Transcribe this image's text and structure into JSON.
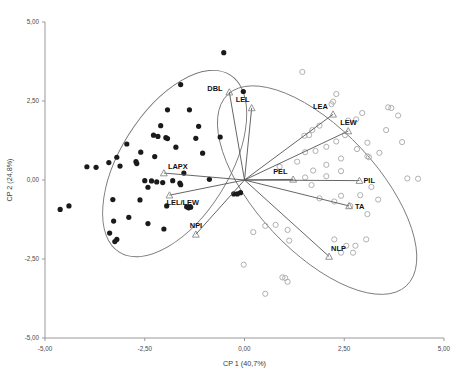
{
  "chart_data": {
    "type": "scatter",
    "subtype": "pca-biplot",
    "title": "",
    "xlabel": "CP 1 (40,7%)",
    "ylabel": "CP 2 (24,8%)",
    "xlim": [
      -5.0,
      5.0
    ],
    "ylim": [
      -5.0,
      5.0
    ],
    "xticks": [
      -5.0,
      -2.5,
      0.0,
      2.5,
      5.0
    ],
    "yticks": [
      -5.0,
      -2.5,
      0.0,
      2.5,
      5.0
    ],
    "xtick_labels": [
      "-5,00",
      "-2,50",
      "0,00",
      "2,50",
      "5,00"
    ],
    "ytick_labels": [
      "-5,00",
      "-2,50",
      "0,00",
      "2,50",
      "5,00"
    ],
    "grid": false,
    "legend": "none",
    "decimal_separator": ",",
    "colors": {
      "group_filled": "#1a1a1a",
      "group_open": "#b0b0b0",
      "vector_line": "#555555",
      "vector_marker": "#888888",
      "ellipse": "#777777",
      "axis": "#999999",
      "text": "#222222",
      "background": "#ffffff"
    },
    "series": [
      {
        "name": "group-1-filled",
        "marker": "filled-circle",
        "color": "#1a1a1a",
        "points": [
          [
            -0.52,
            4.03
          ],
          [
            -4.62,
            -0.93
          ],
          [
            -1.6,
            3.02
          ],
          [
            -0.03,
            2.8
          ],
          [
            -1.93,
            2.22
          ],
          [
            -1.38,
            2.22
          ],
          [
            -2.1,
            1.72
          ],
          [
            -1.15,
            1.7
          ],
          [
            -2.28,
            1.42
          ],
          [
            -2.17,
            1.38
          ],
          [
            -1.97,
            1.34
          ],
          [
            -1.93,
            1.31
          ],
          [
            -1.22,
            1.32
          ],
          [
            -0.61,
            1.36
          ],
          [
            -2.95,
            1.14
          ],
          [
            -1.72,
            1.04
          ],
          [
            -2.6,
            0.88
          ],
          [
            -3.2,
            0.72
          ],
          [
            -2.25,
            0.74
          ],
          [
            -1.05,
            0.85
          ],
          [
            -3.4,
            0.55
          ],
          [
            -2.7,
            0.52
          ],
          [
            -2.72,
            0.58
          ],
          [
            -3.95,
            0.42
          ],
          [
            -3.72,
            0.4
          ],
          [
            -3.12,
            0.44
          ],
          [
            -1.52,
            0.22
          ],
          [
            -0.88,
            0.02
          ],
          [
            -2.5,
            -0.02
          ],
          [
            -2.33,
            -0.03
          ],
          [
            -2.2,
            -0.06
          ],
          [
            -2.05,
            -0.08
          ],
          [
            -1.8,
            -0.02
          ],
          [
            -1.62,
            -0.1
          ],
          [
            -1.6,
            -0.15
          ],
          [
            -2.42,
            -0.23
          ],
          [
            -0.27,
            -0.44
          ],
          [
            -0.18,
            -0.44
          ],
          [
            -0.1,
            -0.4
          ],
          [
            -3.3,
            -0.62
          ],
          [
            -2.62,
            -0.63
          ],
          [
            -1.95,
            -0.82
          ],
          [
            -1.45,
            -0.85
          ],
          [
            -1.4,
            -0.88
          ],
          [
            -1.35,
            -0.86
          ],
          [
            -2.9,
            -1.18
          ],
          [
            -3.28,
            -1.3
          ],
          [
            -2.42,
            -1.38
          ],
          [
            -2.02,
            -1.55
          ],
          [
            -3.38,
            -1.68
          ],
          [
            -3.2,
            -1.88
          ],
          [
            -3.25,
            -1.95
          ],
          [
            -4.4,
            -0.82
          ]
        ]
      },
      {
        "name": "group-2-open",
        "marker": "open-circle",
        "color": "#b0b0b0",
        "points": [
          [
            1.45,
            3.42
          ],
          [
            2.3,
            2.72
          ],
          [
            2.22,
            2.48
          ],
          [
            2.18,
            2.4
          ],
          [
            3.6,
            2.3
          ],
          [
            3.68,
            2.28
          ],
          [
            2.95,
            2.12
          ],
          [
            3.85,
            2.04
          ],
          [
            2.8,
            1.92
          ],
          [
            2.6,
            1.88
          ],
          [
            1.88,
            1.72
          ],
          [
            1.7,
            1.58
          ],
          [
            3.55,
            1.58
          ],
          [
            1.62,
            1.42
          ],
          [
            1.5,
            1.4
          ],
          [
            2.52,
            1.42
          ],
          [
            2.3,
            1.22
          ],
          [
            3.08,
            1.18
          ],
          [
            3.95,
            1.2
          ],
          [
            2.05,
            1.05
          ],
          [
            2.82,
            0.98
          ],
          [
            1.78,
            0.92
          ],
          [
            1.52,
            0.88
          ],
          [
            3.38,
            0.86
          ],
          [
            3.08,
            0.75
          ],
          [
            3.12,
            0.72
          ],
          [
            2.42,
            0.68
          ],
          [
            1.32,
            0.58
          ],
          [
            2.05,
            0.48
          ],
          [
            0.88,
            0.42
          ],
          [
            1.72,
            0.3
          ],
          [
            2.42,
            0.28
          ],
          [
            2.05,
            0.12
          ],
          [
            1.52,
            0.08
          ],
          [
            4.08,
            0.05
          ],
          [
            4.35,
            0.04
          ],
          [
            1.68,
            -0.16
          ],
          [
            3.18,
            -0.22
          ],
          [
            2.9,
            -0.48
          ],
          [
            2.42,
            -0.5
          ],
          [
            1.88,
            -0.58
          ],
          [
            2.25,
            -0.68
          ],
          [
            3.35,
            -0.62
          ],
          [
            2.65,
            -0.82
          ],
          [
            3.08,
            -1.08
          ],
          [
            0.52,
            -1.45
          ],
          [
            0.78,
            -1.42
          ],
          [
            1.08,
            -1.58
          ],
          [
            0.22,
            -1.65
          ],
          [
            2.25,
            -1.88
          ],
          [
            1.12,
            -1.92
          ],
          [
            3.05,
            -1.88
          ],
          [
            2.55,
            -2.08
          ],
          [
            2.78,
            -2.08
          ],
          [
            2.42,
            -2.3
          ],
          [
            2.72,
            -2.3
          ],
          [
            -0.02,
            -2.68
          ],
          [
            0.95,
            -3.08
          ],
          [
            1.02,
            -3.1
          ],
          [
            1.08,
            -3.22
          ],
          [
            0.52,
            -3.6
          ]
        ]
      }
    ],
    "vectors": [
      {
        "label": "DBL",
        "x": -0.38,
        "y": 2.78
      },
      {
        "label": "LEL",
        "x": 0.18,
        "y": 2.28
      },
      {
        "label": "LEA",
        "x": 2.22,
        "y": 2.08
      },
      {
        "label": "LEW",
        "x": 2.6,
        "y": 1.55
      },
      {
        "label": "PEL",
        "x": 1.22,
        "y": 0.02
      },
      {
        "label": "PIL",
        "x": 2.88,
        "y": -0.02
      },
      {
        "label": "TA",
        "x": 2.62,
        "y": -0.82
      },
      {
        "label": "NLP",
        "x": 2.12,
        "y": -2.42
      },
      {
        "label": "LAPX",
        "x": -2.02,
        "y": 0.22
      },
      {
        "label": "LEL/LEW",
        "x": -1.88,
        "y": -0.48
      },
      {
        "label": "NPI",
        "x": -1.22,
        "y": -1.72
      }
    ],
    "vector_label_offsets": {
      "DBL": {
        "dx": -22,
        "dy": -1
      },
      "LEL": {
        "dx": -16,
        "dy": -6
      },
      "LEA": {
        "dx": -20,
        "dy": -5
      },
      "LEW": {
        "dx": -8,
        "dy": -6
      },
      "PEL": {
        "dx": -20,
        "dy": -5
      },
      "PIL": {
        "dx": 4,
        "dy": 2
      },
      "TA": {
        "dx": 6,
        "dy": 3
      },
      "NLP": {
        "dx": 2,
        "dy": -5
      },
      "LAPX": {
        "dx": 4,
        "dy": -4
      },
      "LEL/LEW": {
        "dx": -3,
        "dy": 10
      },
      "NPI": {
        "dx": -6,
        "dy": -6
      }
    },
    "ellipses": [
      {
        "name": "group-1-ellipse",
        "cx": -1.75,
        "cy": 0.52,
        "rx": 2.62,
        "ry": 1.72,
        "rotation": -58
      },
      {
        "name": "group-2-ellipse",
        "cx": 1.82,
        "cy": -0.32,
        "rx": 3.28,
        "ry": 1.92,
        "rotation": 47
      }
    ]
  }
}
